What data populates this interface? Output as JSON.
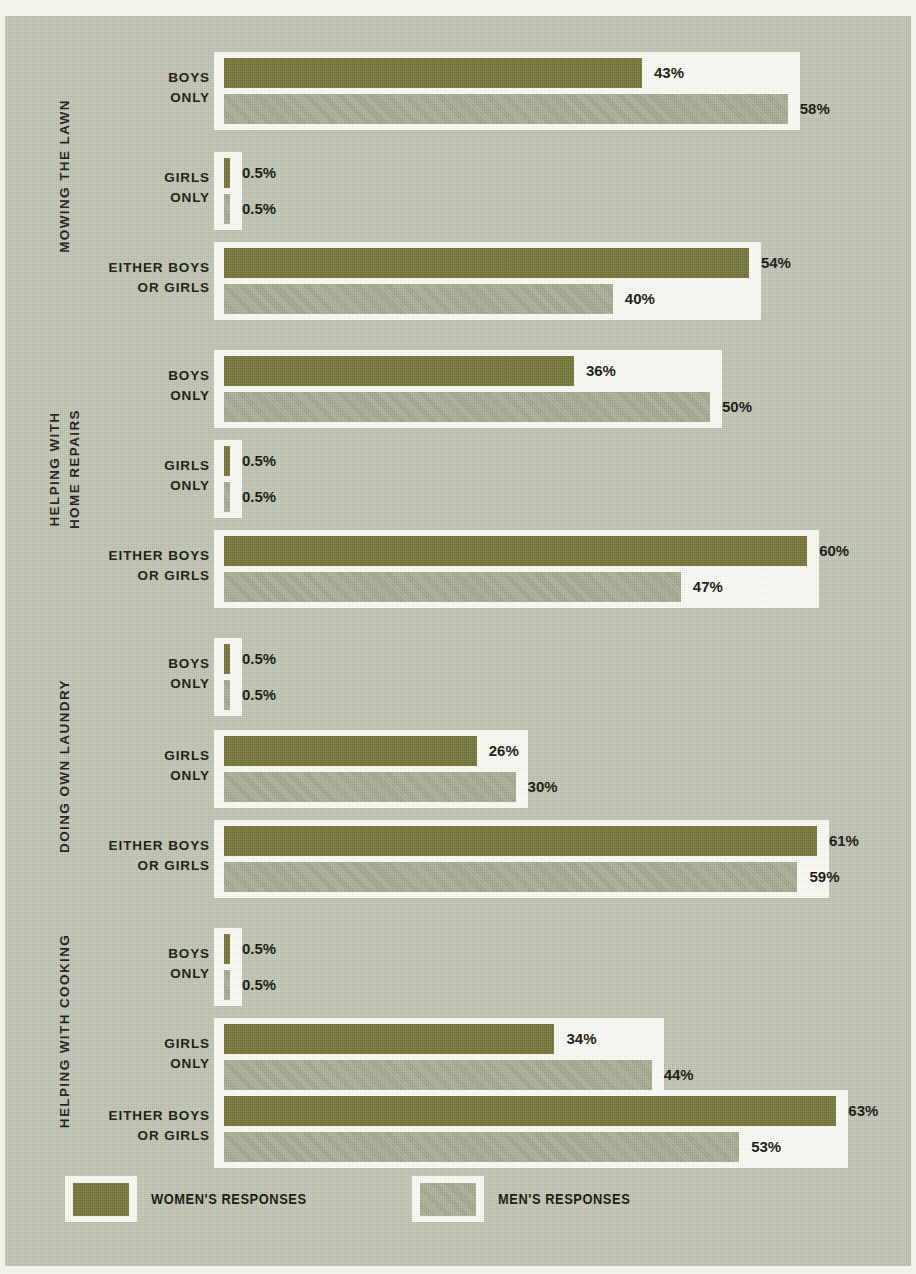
{
  "legend": {
    "items": [
      {
        "label": "WOMEN'S RESPONSES",
        "color": "#76773a",
        "icon": "legend-swatch-women"
      },
      {
        "label": "MEN'S RESPONSES",
        "color": "#a5ab8e",
        "icon": "legend-swatch-men"
      }
    ]
  },
  "colors": {
    "background": "#c2c6b4",
    "page_margin": "#f3f2ea",
    "bar_frame": "#fdfdf7",
    "women": "#76773a",
    "men": "#a5ab8e",
    "text": "#17170f"
  },
  "chart_data": {
    "type": "bar",
    "orientation": "horizontal",
    "title": "",
    "xlabel": "",
    "ylabel": "",
    "xlim": [
      0,
      70
    ],
    "grid": false,
    "legend_position": "bottom-left",
    "value_suffix": "%",
    "series": [
      {
        "name": "WOMEN'S RESPONSES",
        "color": "#76773a"
      },
      {
        "name": "MEN'S RESPONSES",
        "color": "#a5ab8e"
      }
    ],
    "groups": [
      {
        "label": "MOWING THE LAWN",
        "label_lines": [
          "MOWING THE LAWN"
        ],
        "rows": [
          {
            "label_lines": [
              "BOYS",
              "ONLY"
            ],
            "women": 43,
            "men": 58,
            "women_text": "43%",
            "men_text": "58%"
          },
          {
            "label_lines": [
              "GIRLS",
              "ONLY"
            ],
            "women": 0.5,
            "men": 0.5,
            "women_text": "0.5%",
            "men_text": "0.5%"
          },
          {
            "label_lines": [
              "EITHER BOYS",
              "OR GIRLS"
            ],
            "women": 54,
            "men": 40,
            "women_text": "54%",
            "men_text": "40%"
          }
        ]
      },
      {
        "label": "HELPING WITH HOME REPAIRS",
        "label_lines": [
          "HELPING WITH",
          "HOME REPAIRS"
        ],
        "rows": [
          {
            "label_lines": [
              "BOYS",
              "ONLY"
            ],
            "women": 36,
            "men": 50,
            "women_text": "36%",
            "men_text": "50%"
          },
          {
            "label_lines": [
              "GIRLS",
              "ONLY"
            ],
            "women": 0.5,
            "men": 0.5,
            "women_text": "0.5%",
            "men_text": "0.5%"
          },
          {
            "label_lines": [
              "EITHER BOYS",
              "OR GIRLS"
            ],
            "women": 60,
            "men": 47,
            "women_text": "60%",
            "men_text": "47%"
          }
        ]
      },
      {
        "label": "DOING OWN LAUNDRY",
        "label_lines": [
          "DOING OWN LAUNDRY"
        ],
        "rows": [
          {
            "label_lines": [
              "BOYS",
              "ONLY"
            ],
            "women": 0.5,
            "men": 0.5,
            "women_text": "0.5%",
            "men_text": "0.5%"
          },
          {
            "label_lines": [
              "GIRLS",
              "ONLY"
            ],
            "women": 26,
            "men": 30,
            "women_text": "26%",
            "men_text": "30%"
          },
          {
            "label_lines": [
              "EITHER BOYS",
              "OR GIRLS"
            ],
            "women": 61,
            "men": 59,
            "women_text": "61%",
            "men_text": "59%"
          }
        ]
      },
      {
        "label": "HELPING WITH COOKING",
        "label_lines": [
          "HELPING WITH COOKING"
        ],
        "rows": [
          {
            "label_lines": [
              "BOYS",
              "ONLY"
            ],
            "women": 0.5,
            "men": 0.5,
            "women_text": "0.5%",
            "men_text": "0.5%"
          },
          {
            "label_lines": [
              "GIRLS",
              "ONLY"
            ],
            "women": 34,
            "men": 44,
            "women_text": "34%",
            "men_text": "44%"
          },
          {
            "label_lines": [
              "EITHER BOYS",
              "OR GIRLS"
            ],
            "women": 63,
            "men": 53,
            "women_text": "63%",
            "men_text": "53%"
          }
        ]
      }
    ]
  }
}
